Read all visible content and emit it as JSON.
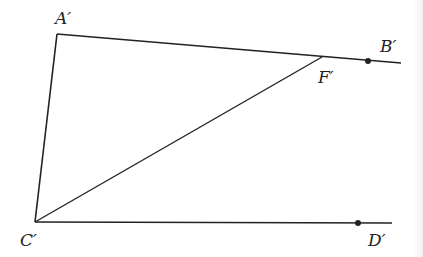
{
  "diagram": {
    "type": "geometry-figure",
    "colors": {
      "stroke": "#222222",
      "background": "#ffffff"
    },
    "points": {
      "A": {
        "label": "A′",
        "x": 57,
        "y": 34
      },
      "C": {
        "label": "C′",
        "x": 35,
        "y": 222
      },
      "F": {
        "label": "F′",
        "x": 322,
        "y": 57
      },
      "B": {
        "label": "B′",
        "x": 368,
        "y": 61,
        "marked": true
      },
      "D": {
        "label": "D′",
        "x": 358,
        "y": 223,
        "marked": true
      }
    },
    "segments": [
      {
        "from": "A",
        "to": "C"
      },
      {
        "from": "A",
        "to": "ray_B_end",
        "through": [
          "F",
          "B"
        ]
      },
      {
        "from": "C",
        "to": "F"
      },
      {
        "from": "C",
        "to": "ray_D_end",
        "through": [
          "D"
        ]
      }
    ],
    "ray_ends": {
      "ray_B_end": {
        "x": 401,
        "y": 63
      },
      "ray_D_end": {
        "x": 392,
        "y": 223
      }
    },
    "labels": {
      "a": "A′",
      "b": "B′",
      "c": "C′",
      "d": "D′",
      "f": "F′"
    }
  }
}
